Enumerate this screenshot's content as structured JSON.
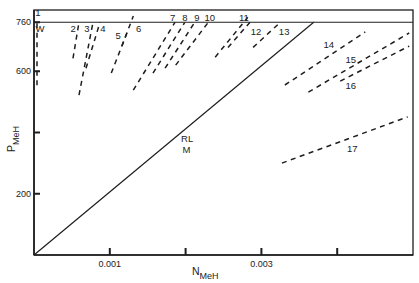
{
  "chart_data": {
    "type": "line",
    "title": "",
    "xlabel": "N",
    "xlabel_sub": "MeH",
    "ylabel": "P",
    "ylabel_sub": "MeH",
    "xlim": [
      0,
      0.005
    ],
    "ylim": [
      0,
      800
    ],
    "grid": false,
    "legend": "none (series numbered inline)",
    "x_ticks": [
      {
        "value": 0.001,
        "label": "0.001"
      },
      {
        "value": 0.002,
        "label": ""
      },
      {
        "value": 0.003,
        "label": "0.003"
      },
      {
        "value": 0.004,
        "label": ""
      }
    ],
    "y_ticks": [
      {
        "value": 200,
        "label": "200"
      },
      {
        "value": 400,
        "label": ""
      },
      {
        "value": 600,
        "label": "600"
      },
      {
        "value": 760,
        "label": "760"
      }
    ],
    "reference_lines": [
      {
        "name": "P = 760",
        "y": 760,
        "style": "solid"
      }
    ],
    "series": [
      {
        "name": "RL/M",
        "style": "solid",
        "points": [
          [
            0,
            0
          ],
          [
            0.00369,
            760
          ]
        ]
      },
      {
        "name": "1",
        "style": "dashed",
        "points": [
          [
            4e-05,
            554
          ],
          [
            4e-05,
            760
          ]
        ],
        "label_pos": [
          5e-05,
          791
        ]
      },
      {
        "name": "2",
        "style": "dashed",
        "points": [
          [
            0.000515,
            642
          ],
          [
            0.000594,
            760
          ]
        ],
        "label_pos": [
          0.000515,
          741
        ]
      },
      {
        "name": "3",
        "style": "dashed",
        "points": [
          [
            0.000594,
            522
          ],
          [
            0.000778,
            760
          ]
        ],
        "label_pos": [
          0.000699,
          741
        ]
      },
      {
        "name": "4",
        "style": "dashed",
        "points": [
          [
            0.000686,
            610
          ],
          [
            0.000871,
            760
          ]
        ],
        "label_pos": [
          0.00091,
          741
        ]
      },
      {
        "name": "5",
        "style": "dashed",
        "points": [
          [
            0.00102,
            594
          ],
          [
            0.00124,
            734
          ]
        ],
        "label_pos": [
          0.00111,
          718
        ]
      },
      {
        "name": "6",
        "style": "dashed",
        "points": [
          [
            0.00116,
            682
          ],
          [
            0.00131,
            780
          ]
        ],
        "label_pos": [
          0.00138,
          738
        ]
      },
      {
        "name": "7",
        "style": "dashed",
        "points": [
          [
            0.00131,
            538
          ],
          [
            0.00186,
            760
          ]
        ],
        "label_pos": [
          0.00183,
          777
        ]
      },
      {
        "name": "8",
        "style": "dashed",
        "points": [
          [
            0.00157,
            594
          ],
          [
            0.00199,
            760
          ]
        ],
        "label_pos": [
          0.00199,
          777
        ]
      },
      {
        "name": "9",
        "style": "dashed",
        "points": [
          [
            0.00173,
            610
          ],
          [
            0.00212,
            760
          ]
        ],
        "label_pos": [
          0.00215,
          777
        ]
      },
      {
        "name": "10",
        "style": "dashed",
        "points": [
          [
            0.00187,
            620
          ],
          [
            0.0023,
            760
          ]
        ],
        "label_pos": [
          0.00232,
          777
        ]
      },
      {
        "name": "11",
        "style": "dashed",
        "points": [
          [
            0.00239,
            646
          ],
          [
            0.00282,
            776
          ]
        ],
        "label_pos": [
          0.00277,
          777
        ]
      },
      {
        "name": "12",
        "style": "dashed",
        "points": [
          [
            0.00256,
            678
          ],
          [
            0.00285,
            760
          ]
        ],
        "label_pos": [
          0.00293,
          731
        ]
      },
      {
        "name": "13",
        "style": "dashed",
        "points": [
          [
            0.00289,
            678
          ],
          [
            0.00325,
            760
          ]
        ],
        "label_pos": [
          0.0033,
          731
        ]
      },
      {
        "name": "14",
        "style": "dashed",
        "points": [
          [
            0.00331,
            555
          ],
          [
            0.00437,
            728
          ]
        ],
        "label_pos": [
          0.00389,
          686
        ]
      },
      {
        "name": "15",
        "style": "dashed",
        "points": [
          [
            0.00362,
            532
          ],
          [
            0.00495,
            725
          ]
        ],
        "label_pos": [
          0.00418,
          640
        ]
      },
      {
        "name": "16",
        "style": "dashed",
        "points": [
          [
            0.00404,
            568
          ],
          [
            0.00495,
            682
          ]
        ],
        "label_pos": [
          0.00418,
          552
        ]
      },
      {
        "name": "17",
        "style": "dashed",
        "points": [
          [
            0.00327,
            300
          ],
          [
            0.00493,
            451
          ]
        ],
        "label_pos": [
          0.0042,
          349
        ]
      }
    ],
    "annotations": [
      {
        "text": "W",
        "pos": [
          8e-05,
          741
        ]
      },
      {
        "text": "RL",
        "pos": [
          0.00202,
          382
        ]
      },
      {
        "text": "M",
        "pos": [
          0.00201,
          343
        ]
      }
    ]
  }
}
